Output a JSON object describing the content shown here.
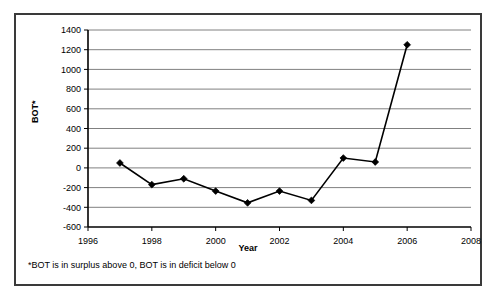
{
  "chart_data": {
    "type": "line",
    "title": "",
    "xlabel": "Year",
    "ylabel": "BOT*",
    "x": [
      1997,
      1998,
      1999,
      2000,
      2001,
      2002,
      2003,
      2004,
      2005,
      2006
    ],
    "values": [
      50,
      -170,
      -110,
      -235,
      -355,
      -235,
      -330,
      100,
      60,
      1250
    ],
    "series": [
      {
        "name": "BOT*",
        "values": [
          50,
          -170,
          -110,
          -235,
          -355,
          -235,
          -330,
          100,
          60,
          1250
        ]
      }
    ],
    "xlim": [
      1996,
      2008
    ],
    "ylim": [
      -600,
      1400
    ],
    "xticks": [
      1996,
      1998,
      2000,
      2002,
      2004,
      2006,
      2008
    ],
    "xtick_labels": [
      "1996",
      "1998",
      "2000",
      "2002",
      "2004",
      "2006",
      "2008"
    ],
    "yticks": [
      -600,
      -400,
      -200,
      0,
      200,
      400,
      600,
      800,
      1000,
      1200,
      1400
    ],
    "ytick_labels": [
      "-600",
      "-400",
      "-200",
      "0",
      "200",
      "400",
      "600",
      "800",
      "1000",
      "1200",
      "1400"
    ],
    "grid": "horizontal",
    "legend": "none",
    "marker": "diamond",
    "annotations": [
      "*BOT is in surplus above 0, BOT is in deficit below 0"
    ]
  },
  "figure": {
    "footnote": "*BOT is in surplus above 0, BOT is in deficit below 0",
    "axis_title_y": "BOT*",
    "axis_title_x": "Year",
    "colors": {
      "line": "#000000",
      "marker": "#000000",
      "grid": "#808080",
      "axis": "#000000",
      "border": "#3a3a3a",
      "background": "#ffffff"
    }
  }
}
